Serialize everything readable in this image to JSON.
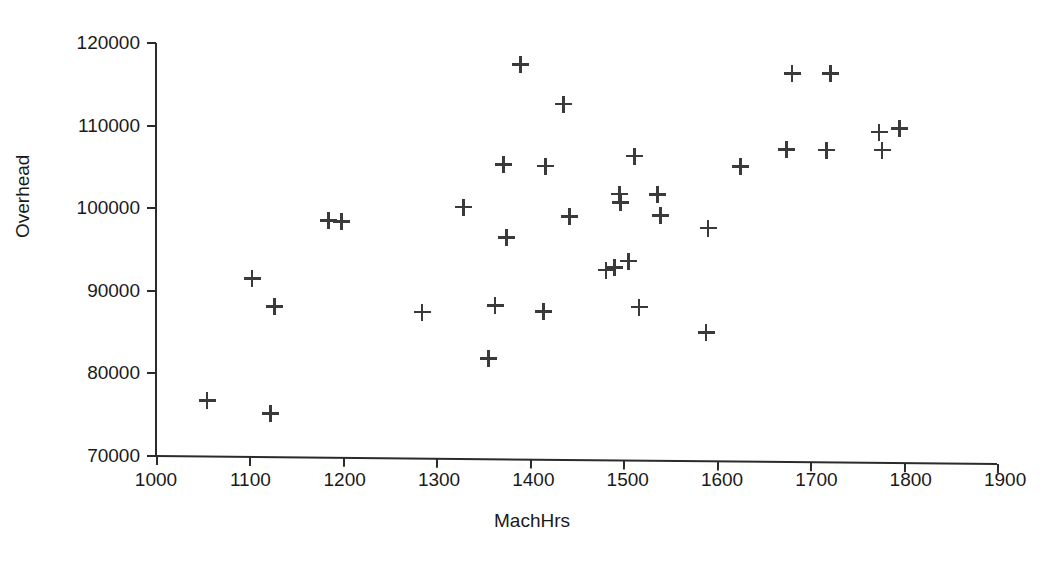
{
  "chart_data": {
    "type": "scatter",
    "title": "",
    "xlabel": "MachHrs",
    "ylabel": "Overhead",
    "xlim": [
      1000,
      1900
    ],
    "ylim": [
      70000,
      120000
    ],
    "xticks": [
      1000,
      1100,
      1200,
      1300,
      1400,
      1500,
      1600,
      1700,
      1800,
      1900
    ],
    "yticks": [
      70000,
      80000,
      90000,
      100000,
      110000,
      120000
    ],
    "xtick_labels": [
      "1000",
      "1100",
      "1200",
      "1300",
      "1400",
      "1500",
      "1600",
      "1700",
      "1800",
      "1900"
    ],
    "ytick_labels": [
      "70000",
      "80000",
      "90000",
      "100000",
      "110000",
      "120000"
    ],
    "grid": false,
    "legend": null,
    "marker": "plus",
    "marker_color": "#3a3a3a",
    "points": [
      {
        "x": 1055,
        "y": 76700
      },
      {
        "x": 1103,
        "y": 91500
      },
      {
        "x": 1123,
        "y": 75100
      },
      {
        "x": 1127,
        "y": 88100
      },
      {
        "x": 1185,
        "y": 98500
      },
      {
        "x": 1199,
        "y": 98400
      },
      {
        "x": 1285,
        "y": 87400
      },
      {
        "x": 1329,
        "y": 100100
      },
      {
        "x": 1356,
        "y": 81800
      },
      {
        "x": 1363,
        "y": 88200
      },
      {
        "x": 1372,
        "y": 105300
      },
      {
        "x": 1375,
        "y": 96400
      },
      {
        "x": 1390,
        "y": 117400
      },
      {
        "x": 1415,
        "y": 87500
      },
      {
        "x": 1417,
        "y": 105100
      },
      {
        "x": 1436,
        "y": 112600
      },
      {
        "x": 1443,
        "y": 99000
      },
      {
        "x": 1482,
        "y": 92500
      },
      {
        "x": 1491,
        "y": 92800
      },
      {
        "x": 1496,
        "y": 101700
      },
      {
        "x": 1497,
        "y": 100700
      },
      {
        "x": 1506,
        "y": 93600
      },
      {
        "x": 1512,
        "y": 106300
      },
      {
        "x": 1517,
        "y": 88000
      },
      {
        "x": 1537,
        "y": 101600
      },
      {
        "x": 1540,
        "y": 99100
      },
      {
        "x": 1589,
        "y": 84900
      },
      {
        "x": 1591,
        "y": 97600
      },
      {
        "x": 1626,
        "y": 105000
      },
      {
        "x": 1675,
        "y": 107100
      },
      {
        "x": 1681,
        "y": 116300
      },
      {
        "x": 1718,
        "y": 107000
      },
      {
        "x": 1722,
        "y": 116300
      },
      {
        "x": 1774,
        "y": 109200
      },
      {
        "x": 1777,
        "y": 107000
      },
      {
        "x": 1796,
        "y": 109600
      }
    ]
  }
}
